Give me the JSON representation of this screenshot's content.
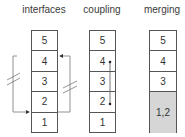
{
  "columns": [
    {
      "title": "interfaces",
      "cells": [
        "5",
        "4",
        "3",
        "2",
        "1"
      ]
    },
    {
      "title": "coupling",
      "cells": [
        "5",
        "4",
        "3",
        "2",
        "1"
      ]
    },
    {
      "title": "merging",
      "cells": [
        "5",
        "4",
        "3",
        "1,2"
      ]
    }
  ],
  "colors": {
    "line": "#555555",
    "merged_fill": "#d6d6d6",
    "background": "#ffffff"
  }
}
